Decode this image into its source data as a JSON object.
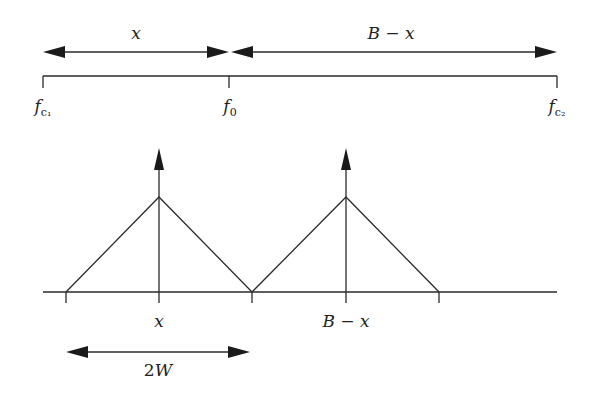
{
  "top": {
    "arrow_left_label": "x",
    "arrow_right_label": "B − x",
    "ticks": [
      {
        "label_main": "f",
        "label_sub": "c₁"
      },
      {
        "label_main": "f",
        "label_sub": "0"
      },
      {
        "label_main": "f",
        "label_sub": "c₂"
      }
    ]
  },
  "bottom": {
    "peak_labels": [
      "x",
      "B − x"
    ],
    "width_label_num": "2",
    "width_label_var": "W"
  },
  "colors": {
    "line": "#2a2a2a",
    "background": "#ffffff"
  }
}
